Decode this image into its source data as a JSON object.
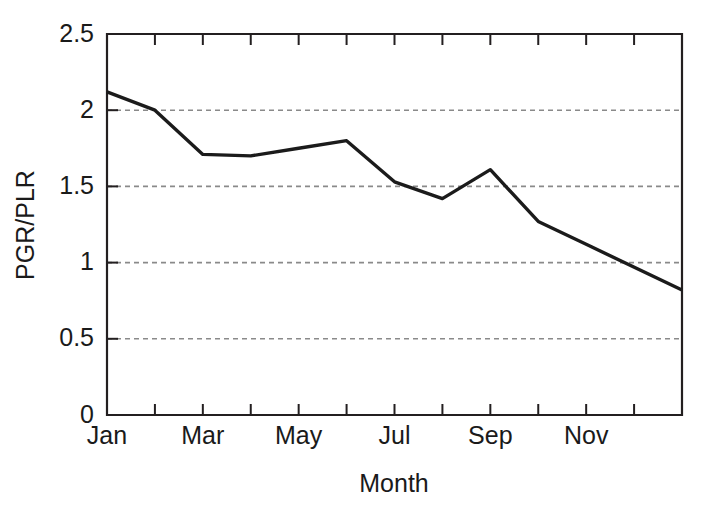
{
  "chart_data": {
    "type": "line",
    "title": "",
    "xlabel": "Month",
    "ylabel": "PGR/PLR",
    "categories": [
      "Jan",
      "Feb",
      "Mar",
      "Apr",
      "May",
      "Jun",
      "Jul",
      "Aug",
      "Sep",
      "Oct",
      "Nov",
      "Dec"
    ],
    "values": [
      2.12,
      2.0,
      1.71,
      1.7,
      1.75,
      1.8,
      1.53,
      1.42,
      1.61,
      1.27,
      1.12,
      0.82
    ],
    "series": [
      {
        "name": "PGR/PLR",
        "color": "#1b1b1b",
        "values": [
          2.12,
          2.0,
          1.71,
          1.7,
          1.75,
          1.8,
          1.53,
          1.42,
          1.61,
          1.27,
          1.12,
          0.82
        ]
      }
    ],
    "ylim": [
      0,
      2.5
    ],
    "y_ticks": [
      0,
      0.5,
      1,
      1.5,
      2,
      2.5
    ],
    "y_tick_labels": [
      "0",
      "0.5",
      "1",
      "1.5",
      "2",
      "2.5"
    ],
    "x_tick_labels_shown": [
      "Jan",
      "Mar",
      "May",
      "Jul",
      "Sep",
      "Nov"
    ],
    "x_tick_count": 12,
    "grid": "horizontal-dashed",
    "gridline_values": [
      0.5,
      1,
      1.5,
      2
    ],
    "grid_color": "#8a8a8a",
    "legend": "none",
    "annotations": []
  },
  "figure": {
    "background_color": "#ffffff",
    "frame_color": "#231f20"
  }
}
